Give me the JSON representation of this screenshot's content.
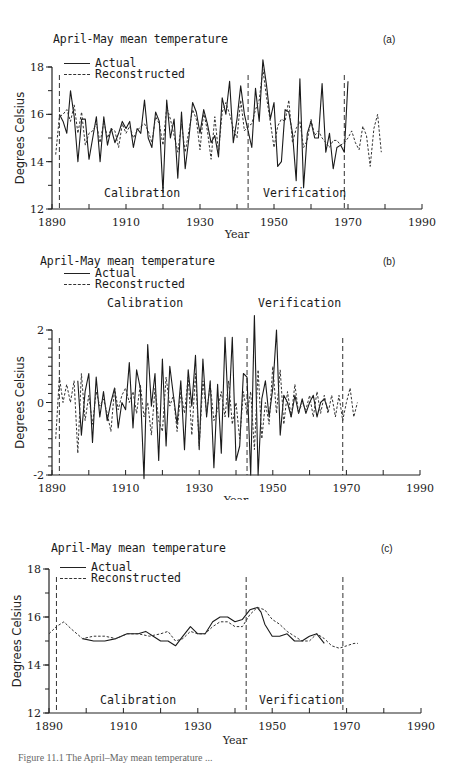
{
  "figure": {
    "caption": "Figure 11.1  The April–May mean temperature ..."
  },
  "panels": [
    {
      "id": "a",
      "title": "April-May mean temperature",
      "panel_label": "(a)",
      "legend": {
        "actual": "Actual",
        "reconstructed": "Reconstructed"
      },
      "regions": {
        "calibration": "Calibration",
        "verification": "Verification"
      },
      "xlabel": "Year",
      "ylabel": "Degrees Celsius",
      "xticks": [
        "1890",
        "1910",
        "1930",
        "1950",
        "1970",
        "1990"
      ],
      "yticks": [
        "12",
        "14",
        "16",
        "18"
      ]
    },
    {
      "id": "b",
      "title": "April-May mean temperature",
      "panel_label": "(b)",
      "legend": {
        "actual": "Actual",
        "reconstructed": "Reconstructed"
      },
      "regions": {
        "calibration": "Calibration",
        "verification": "Verification"
      },
      "xlabel": "Year",
      "ylabel": "Degrees Celsius",
      "xticks": [
        "1890",
        "1910",
        "1930",
        "1950",
        "1970",
        "1990"
      ],
      "yticks": [
        "-2",
        "0",
        "2"
      ]
    },
    {
      "id": "c",
      "title": "April-May mean temperature",
      "panel_label": "(c)",
      "legend": {
        "actual": "Actual",
        "reconstructed": "Reconstructed"
      },
      "regions": {
        "calibration": "Calibration",
        "verification": "Verification"
      },
      "xlabel": "Year",
      "ylabel": "Degrees Celsius",
      "xticks": [
        "1890",
        "1910",
        "1930",
        "1950",
        "1970",
        "1990"
      ],
      "yticks": [
        "12",
        "14",
        "16",
        "18"
      ]
    }
  ],
  "chart_data": [
    {
      "type": "line",
      "title": "April-May mean temperature (a)",
      "xlabel": "Year",
      "ylabel": "Degrees Celsius",
      "xlim": [
        1890,
        1990
      ],
      "ylim": [
        12,
        18
      ],
      "grid": false,
      "legend_position": "top-left",
      "vlines": [
        1892,
        1943,
        1969
      ],
      "annotations": [
        "Calibration",
        "Verification"
      ],
      "series": [
        {
          "name": "Actual",
          "style": "solid",
          "x": [
            1892,
            1893,
            1894,
            1895,
            1896,
            1897,
            1898,
            1899,
            1900,
            1901,
            1902,
            1903,
            1904,
            1905,
            1906,
            1907,
            1908,
            1909,
            1910,
            1911,
            1912,
            1913,
            1914,
            1915,
            1916,
            1917,
            1918,
            1919,
            1920,
            1921,
            1922,
            1923,
            1924,
            1925,
            1926,
            1927,
            1928,
            1929,
            1930,
            1931,
            1932,
            1933,
            1934,
            1935,
            1936,
            1937,
            1938,
            1939,
            1940,
            1941,
            1942,
            1943,
            1944,
            1945,
            1946,
            1947,
            1948,
            1949,
            1950,
            1951,
            1952,
            1953,
            1954,
            1955,
            1956,
            1957,
            1958,
            1959,
            1960,
            1961,
            1962,
            1963,
            1964,
            1965,
            1966,
            1967,
            1968,
            1969,
            1970
          ],
          "values": [
            16.0,
            15.7,
            15.2,
            17.0,
            15.9,
            14.0,
            15.8,
            15.8,
            14.1,
            15.0,
            15.9,
            14.0,
            15.9,
            14.7,
            15.4,
            14.8,
            15.2,
            15.7,
            15.4,
            15.7,
            14.6,
            15.4,
            15.2,
            16.6,
            15.0,
            14.6,
            16.1,
            15.7,
            12.7,
            16.6,
            15.0,
            15.8,
            13.3,
            16.1,
            13.7,
            15.0,
            16.5,
            16.1,
            15.2,
            16.2,
            15.6,
            14.8,
            15.1,
            14.2,
            16.7,
            16.0,
            17.4,
            14.8,
            15.8,
            17.2,
            16.0,
            15.3,
            14.6,
            17.1,
            15.7,
            18.3,
            17.2,
            15.8,
            16.5,
            13.8,
            14.0,
            16.2,
            16.1,
            15.2,
            13.2,
            17.5,
            12.9,
            15.2,
            15.7,
            15.0,
            15.0,
            17.3,
            14.4,
            15.2,
            13.7,
            14.6,
            14.7,
            14.4,
            17.4
          ]
        },
        {
          "name": "Reconstructed",
          "style": "dashed",
          "x": [
            1891,
            1892,
            1893,
            1894,
            1895,
            1896,
            1897,
            1898,
            1899,
            1900,
            1901,
            1902,
            1903,
            1904,
            1905,
            1906,
            1907,
            1908,
            1909,
            1910,
            1911,
            1912,
            1913,
            1914,
            1915,
            1916,
            1917,
            1918,
            1919,
            1920,
            1921,
            1922,
            1923,
            1924,
            1925,
            1926,
            1927,
            1928,
            1929,
            1930,
            1931,
            1932,
            1933,
            1934,
            1935,
            1936,
            1937,
            1938,
            1939,
            1940,
            1941,
            1942,
            1943,
            1944,
            1945,
            1946,
            1947,
            1948,
            1949,
            1950,
            1951,
            1952,
            1953,
            1954,
            1955,
            1956,
            1957,
            1958,
            1959,
            1960,
            1961,
            1962,
            1963,
            1964,
            1965,
            1966,
            1967,
            1968,
            1969,
            1970,
            1971,
            1972,
            1973,
            1974,
            1975,
            1976,
            1977,
            1978,
            1979
          ],
          "values": [
            14.3,
            15.9,
            16.0,
            16.2,
            15.7,
            16.4,
            15.2,
            16.1,
            14.7,
            15.2,
            15.3,
            15.6,
            14.8,
            15.7,
            15.0,
            15.4,
            15.3,
            14.6,
            15.6,
            15.2,
            15.5,
            15.0,
            15.3,
            15.5,
            15.6,
            15.3,
            14.8,
            15.9,
            15.6,
            14.7,
            16.3,
            15.8,
            15.1,
            14.4,
            15.6,
            14.4,
            15.3,
            16.2,
            15.8,
            14.5,
            16.1,
            15.3,
            14.1,
            15.9,
            14.4,
            16.1,
            16.5,
            16.0,
            15.4,
            15.0,
            16.6,
            15.3,
            15.5,
            15.6,
            16.2,
            16.6,
            17.9,
            16.7,
            15.7,
            14.6,
            15.5,
            15.8,
            15.7,
            16.6,
            14.8,
            15.4,
            15.7,
            14.6,
            14.9,
            15.8,
            15.1,
            15.3,
            15.0,
            14.8,
            14.6,
            14.9,
            14.9,
            14.7,
            14.8,
            15.0,
            15.3,
            14.8,
            14.5,
            15.5,
            15.1,
            13.8,
            15.4,
            16.0,
            14.4
          ]
        }
      ]
    },
    {
      "type": "line",
      "title": "April-May mean temperature (b)",
      "xlabel": "Year",
      "ylabel": "Degrees Celsius",
      "xlim": [
        1890,
        1990
      ],
      "ylim": [
        -2,
        2
      ],
      "grid": false,
      "legend_position": "top-left",
      "vlines": [
        1892,
        1943,
        1969
      ],
      "annotations": [
        "Calibration",
        "Verification"
      ],
      "series": [
        {
          "name": "Actual",
          "style": "solid",
          "x": [
            1897,
            1898,
            1899,
            1900,
            1901,
            1902,
            1903,
            1904,
            1905,
            1906,
            1907,
            1908,
            1909,
            1910,
            1911,
            1912,
            1913,
            1914,
            1915,
            1916,
            1917,
            1918,
            1919,
            1920,
            1921,
            1922,
            1923,
            1924,
            1925,
            1926,
            1927,
            1928,
            1929,
            1930,
            1931,
            1932,
            1933,
            1934,
            1935,
            1936,
            1937,
            1938,
            1939,
            1940,
            1941,
            1942,
            1943,
            1944,
            1945,
            1946,
            1947,
            1948,
            1949,
            1950,
            1951,
            1952,
            1953,
            1954,
            1955,
            1956,
            1957,
            1958,
            1959,
            1960,
            1961,
            1962,
            1963,
            1964,
            1965
          ],
          "values": [
            0.6,
            -0.9,
            0.3,
            0.8,
            -1.1,
            0.7,
            -0.4,
            0.3,
            -0.5,
            0.0,
            0.4,
            -0.7,
            0.0,
            -0.2,
            1.1,
            -0.7,
            0.9,
            0.4,
            -2.1,
            1.6,
            -0.1,
            0.8,
            -1.6,
            1.2,
            -1.2,
            1.0,
            0.2,
            -0.6,
            0.6,
            -1.3,
            0.9,
            -0.1,
            1.3,
            -1.3,
            1.2,
            -0.4,
            0.6,
            -1.8,
            0.5,
            -1.4,
            1.8,
            -0.4,
            1.8,
            -1.6,
            -1.2,
            0.8,
            0.7,
            -2.0,
            2.4,
            -2.0,
            0.1,
            0.6,
            -0.4,
            0.4,
            2.0,
            -0.9,
            0.2,
            0.0,
            -0.4,
            0.2,
            -0.3,
            0.1,
            -0.3,
            0.0,
            0.2,
            -0.4,
            0.0,
            0.1,
            -0.2
          ]
        },
        {
          "name": "Reconstructed",
          "style": "dashed",
          "x": [
            1891,
            1892,
            1893,
            1894,
            1895,
            1896,
            1897,
            1898,
            1899,
            1900,
            1901,
            1902,
            1903,
            1904,
            1905,
            1906,
            1907,
            1908,
            1909,
            1910,
            1911,
            1912,
            1913,
            1914,
            1915,
            1916,
            1917,
            1918,
            1919,
            1920,
            1921,
            1922,
            1923,
            1924,
            1925,
            1926,
            1927,
            1928,
            1929,
            1930,
            1931,
            1932,
            1933,
            1934,
            1935,
            1936,
            1937,
            1938,
            1939,
            1940,
            1941,
            1942,
            1943,
            1944,
            1945,
            1946,
            1947,
            1948,
            1949,
            1950,
            1951,
            1952,
            1953,
            1954,
            1955,
            1956,
            1957,
            1958,
            1959,
            1960,
            1961,
            1962,
            1963,
            1964,
            1965,
            1966,
            1967,
            1968,
            1969,
            1970,
            1971,
            1972,
            1973
          ],
          "values": [
            -1.0,
            0.7,
            0.0,
            0.5,
            0.0,
            0.6,
            -1.4,
            0.8,
            -0.5,
            0.2,
            -0.6,
            0.3,
            -0.1,
            0.1,
            -0.3,
            -0.8,
            0.4,
            -0.2,
            0.2,
            0.4,
            0.0,
            0.3,
            -0.3,
            0.5,
            -0.4,
            0.0,
            -0.9,
            0.4,
            -0.5,
            -0.8,
            0.7,
            -0.1,
            0.2,
            -0.8,
            0.3,
            -0.3,
            0.7,
            -0.9,
            0.8,
            -1.2,
            0.6,
            -0.3,
            0.5,
            -0.5,
            -0.2,
            0.3,
            -0.4,
            0.6,
            -0.6,
            0.0,
            -1.0,
            0.3,
            -0.3,
            0.3,
            -1.3,
            0.9,
            -1.0,
            0.0,
            -0.6,
            1.0,
            -0.3,
            0.9,
            -0.6,
            0.3,
            -0.4,
            0.5,
            -0.3,
            0.0,
            -0.2,
            0.2,
            -0.4,
            0.3,
            -0.3,
            0.2,
            -0.3,
            0.2,
            -0.4,
            0.2,
            -0.5,
            0.0,
            0.4,
            -0.4,
            0.0
          ]
        }
      ]
    },
    {
      "type": "line",
      "title": "April-May mean temperature (c)",
      "xlabel": "Year",
      "ylabel": "Degrees Celsius",
      "xlim": [
        1890,
        1990
      ],
      "ylim": [
        12,
        18
      ],
      "grid": false,
      "legend_position": "top-left",
      "vlines": [
        1892,
        1943,
        1969
      ],
      "annotations": [
        "Calibration",
        "Verification"
      ],
      "series": [
        {
          "name": "Actual",
          "style": "solid",
          "x": [
            1899,
            1902,
            1905,
            1908,
            1911,
            1914,
            1916,
            1918,
            1920,
            1922,
            1924,
            1926,
            1928,
            1930,
            1932,
            1934,
            1936,
            1938,
            1940,
            1942,
            1944,
            1946,
            1947,
            1948,
            1950,
            1952,
            1954,
            1956,
            1958,
            1960,
            1962,
            1964
          ],
          "values": [
            15.1,
            15.0,
            15.0,
            15.1,
            15.3,
            15.3,
            15.4,
            15.2,
            15.0,
            15.0,
            14.8,
            15.2,
            15.6,
            15.3,
            15.3,
            15.8,
            16.0,
            16.0,
            15.8,
            15.9,
            16.3,
            16.4,
            16.2,
            15.7,
            15.2,
            15.2,
            15.3,
            15.0,
            15.0,
            15.2,
            15.3,
            14.9
          ]
        },
        {
          "name": "Reconstructed",
          "style": "dashed",
          "x": [
            1890,
            1892,
            1894,
            1896,
            1899,
            1902,
            1905,
            1908,
            1911,
            1914,
            1917,
            1920,
            1922,
            1924,
            1926,
            1928,
            1930,
            1932,
            1934,
            1936,
            1938,
            1940,
            1942,
            1944,
            1946,
            1948,
            1950,
            1952,
            1954,
            1956,
            1958,
            1960,
            1962,
            1964,
            1966,
            1968,
            1970,
            1972,
            1973
          ],
          "values": [
            15.3,
            15.6,
            15.8,
            15.5,
            15.1,
            15.2,
            15.2,
            15.1,
            15.3,
            15.3,
            15.2,
            15.3,
            15.4,
            15.0,
            15.1,
            15.4,
            15.3,
            15.3,
            15.6,
            15.8,
            15.8,
            15.6,
            15.6,
            16.1,
            16.4,
            16.3,
            15.9,
            15.7,
            15.4,
            15.2,
            15.0,
            15.0,
            15.3,
            15.1,
            14.8,
            14.7,
            14.8,
            14.9,
            14.9
          ]
        }
      ]
    }
  ]
}
